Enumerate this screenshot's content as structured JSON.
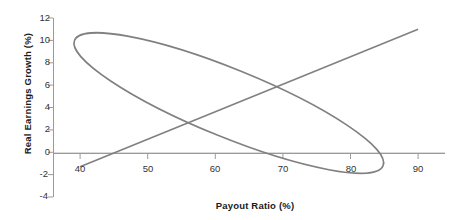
{
  "chart_data": {
    "type": "scatter",
    "title": "",
    "subtitle": "",
    "xlabel": "Payout Ratio (%)",
    "ylabel": "Real Earnings Growth (%)",
    "xlim": [
      36,
      94
    ],
    "ylim": [
      -4,
      12
    ],
    "xticks": [
      40,
      50,
      60,
      70,
      80,
      90
    ],
    "yticks": [
      -4,
      -2,
      0,
      2,
      4,
      6,
      8,
      10,
      12
    ],
    "xtick_labels": [
      "40",
      "50",
      "60",
      "70",
      "80",
      "90"
    ],
    "ytick_labels": [
      "-4",
      "-2",
      "0",
      "2",
      "4",
      "6",
      "8",
      "10",
      "12"
    ],
    "grid": false,
    "legend": "none",
    "zero_line": true,
    "series": [
      {
        "name": "regression-line",
        "type": "line",
        "points": [
          [
            40,
            -1.3
          ],
          [
            90,
            11.0
          ]
        ],
        "color": "#808080"
      },
      {
        "name": "confidence-ellipse",
        "type": "ellipse",
        "center_x": 62,
        "center_y": 4.4,
        "semi_major": 23.5,
        "semi_minor": 3.1,
        "rotation_deg": -13.8,
        "left_tip": [
          40,
          -1.0
        ],
        "right_tip": [
          84,
          10.0
        ],
        "bottom_min": [
          49,
          -1.7
        ],
        "top_max": [
          75,
          10.6
        ],
        "color": "#808080"
      }
    ],
    "colors": {
      "line": "#808080",
      "axis": "#999999",
      "zero_line": "#b3b3b3",
      "text": "#333333",
      "title_text": "#1a1a1a",
      "background": "#ffffff"
    }
  }
}
